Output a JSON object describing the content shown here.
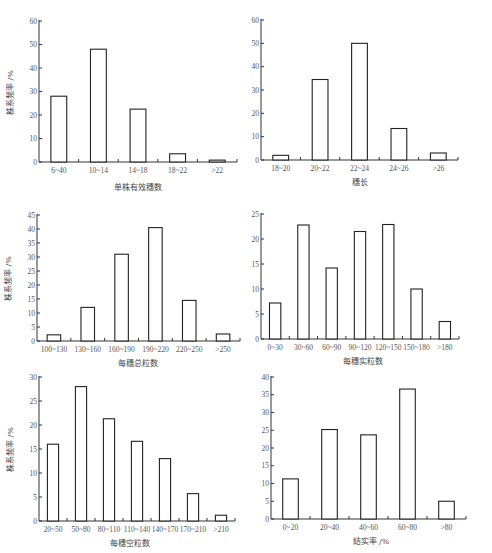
{
  "chart_data": [
    {
      "type": "bar",
      "title": "",
      "xlabel": "单株有效穗数",
      "ylabel": "株系频率 /%",
      "categories": [
        "6-40",
        "10-14",
        "14-18",
        "18-22",
        ">22"
      ],
      "values": [
        28,
        48,
        22.5,
        3.5,
        0.8
      ],
      "ylim": [
        0,
        60
      ],
      "yticks": [
        0,
        10,
        20,
        30,
        40,
        50,
        60
      ],
      "grid": false
    },
    {
      "type": "bar",
      "title": "",
      "xlabel": "穗长",
      "ylabel": "",
      "categories": [
        "18-20",
        "20-22",
        "22-24",
        "24-26",
        ">26"
      ],
      "values": [
        2,
        34.5,
        50,
        13.5,
        3
      ],
      "ylim": [
        0,
        60
      ],
      "yticks": [
        0,
        10,
        20,
        30,
        40,
        50,
        60
      ],
      "grid": false
    },
    {
      "type": "bar",
      "title": "",
      "xlabel": "每穗总粒数",
      "ylabel": "株系频率 /%",
      "categories": [
        "100-130",
        "130-160",
        "160-190",
        "190-220",
        "220-250",
        ">250"
      ],
      "values": [
        2.2,
        12,
        31,
        40.5,
        14.5,
        2.5
      ],
      "ylim": [
        0,
        45
      ],
      "yticks": [
        0,
        5,
        10,
        15,
        20,
        25,
        30,
        35,
        40,
        45
      ],
      "grid": false
    },
    {
      "type": "bar",
      "title": "",
      "xlabel": "每穗实粒数",
      "ylabel": "",
      "categories": [
        "0-30",
        "30-60",
        "60-90",
        "90-120",
        "120-150",
        "150-180",
        ">180"
      ],
      "values": [
        7.2,
        22.8,
        14.2,
        21.5,
        22.9,
        10,
        3.5
      ],
      "ylim": [
        0,
        25
      ],
      "yticks": [
        0,
        5,
        10,
        15,
        20,
        25
      ],
      "grid": false
    },
    {
      "type": "bar",
      "title": "",
      "xlabel": "每穗空粒数",
      "ylabel": "株系频率 /%",
      "categories": [
        "20-50",
        "50-80",
        "80-110",
        "110-140",
        "140-170",
        "170-210",
        ">210"
      ],
      "values": [
        16,
        28,
        21.3,
        16.6,
        13,
        5.7,
        1.2
      ],
      "ylim": [
        0,
        30
      ],
      "yticks": [
        0,
        5,
        10,
        15,
        20,
        25,
        30
      ],
      "grid": false
    },
    {
      "type": "bar",
      "title": "",
      "xlabel": "结实率 /%",
      "ylabel": "",
      "categories": [
        "0-20",
        "20-40",
        "40-60",
        "60-80",
        ">80"
      ],
      "values": [
        11.3,
        25.2,
        23.7,
        36.6,
        5
      ],
      "ylim": [
        0,
        40
      ],
      "yticks": [
        0,
        5,
        10,
        15,
        20,
        25,
        30,
        35,
        40
      ],
      "grid": false
    }
  ],
  "layout": [
    {
      "x0": 39,
      "y0": 162,
      "w": 198,
      "h": 141,
      "xlab_x": 138,
      "xlab_y": 187,
      "ylab": true
    },
    {
      "x0": 261,
      "y0": 160,
      "w": 197,
      "h": 140,
      "xlab_x": 360,
      "xlab_y": 182,
      "ylab": false
    },
    {
      "x0": 37,
      "y0": 341,
      "w": 203,
      "h": 126,
      "xlab_x": 138,
      "xlab_y": 363,
      "ylab": true
    },
    {
      "x0": 261,
      "y0": 339,
      "w": 198,
      "h": 125,
      "xlab_x": 363,
      "xlab_y": 361,
      "ylab": false
    },
    {
      "x0": 39,
      "y0": 521,
      "w": 196,
      "h": 144,
      "xlab_x": 130,
      "xlab_y": 543,
      "ylab": true
    },
    {
      "x0": 271,
      "y0": 519,
      "w": 195,
      "h": 142,
      "xlab_x": 371,
      "xlab_y": 541,
      "ylab": false
    }
  ],
  "colors": {
    "axis": "#333333",
    "bar_stroke": "#222222",
    "bar_fill": "#ffffff",
    "text": "#555555"
  }
}
